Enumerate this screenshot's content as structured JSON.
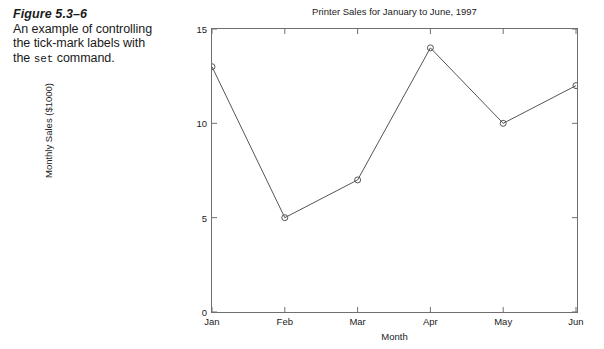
{
  "caption": {
    "figure_number": "Figure 5.3–6",
    "line1": "An example of controlling",
    "line2": "the tick-mark labels with",
    "line3_before": "the ",
    "line3_code": "set",
    "line3_after": " command."
  },
  "chart_data": {
    "type": "line",
    "title": "Printer Sales for January to June, 1997",
    "xlabel": "Month",
    "ylabel": "Monthly Sales ($1000)",
    "categories": [
      "Jan",
      "Feb",
      "Mar",
      "Apr",
      "May",
      "Jun"
    ],
    "values": [
      13,
      5,
      7,
      14,
      10,
      12
    ],
    "ylim": [
      0,
      15
    ],
    "yticks": [
      0,
      5,
      10,
      15
    ],
    "ytick_labels": [
      "0",
      "5",
      "10",
      "15"
    ],
    "xtick_labels": [
      "Jan",
      "Feb",
      "Mar",
      "Apr",
      "May",
      "Jun"
    ],
    "grid": false,
    "legend": null,
    "marker": "circle",
    "line_color": "#555555",
    "marker_color": "#555555",
    "axis_color": "#6f6f6f",
    "background": "#ffffff"
  }
}
